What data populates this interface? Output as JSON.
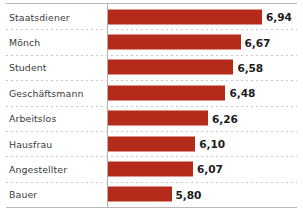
{
  "chart_data": {
    "type": "bar",
    "orientation": "horizontal",
    "title": "",
    "subtitle": "",
    "xlabel": "",
    "ylabel": "",
    "legend": [],
    "grid": "dotted-row-separators",
    "axis_origin": 5.0,
    "xlim": [
      5.0,
      7.1
    ],
    "value_format": "german-decimal-comma",
    "categories": [
      "Staatsdiener",
      "Mönch",
      "Student",
      "Geschäftsmann",
      "Arbeitslos",
      "Hausfrau",
      "Angestellter",
      "Bauer"
    ],
    "values": [
      6.94,
      6.67,
      6.58,
      6.48,
      6.26,
      6.1,
      6.07,
      5.8
    ],
    "value_labels": [
      "6,94",
      "6,67",
      "6,58",
      "6,48",
      "6,26",
      "6,10",
      "6,07",
      "5,80"
    ],
    "bar_color": "#b52b19",
    "label_color": "#3b3b3b",
    "value_color": "#1c1c1c",
    "axis_color": "#b0b0b0",
    "separator_color": "#c8c8c8"
  }
}
